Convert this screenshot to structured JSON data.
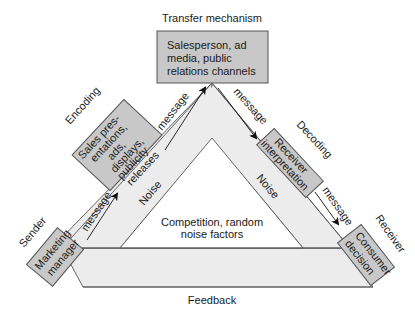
{
  "diagram": {
    "title_top": "Transfer mechanism",
    "bottom_label": "Feedback",
    "center_label": [
      "Competition, random",
      "noise factors"
    ],
    "stages": {
      "sender": {
        "role": "Sender",
        "box_lines": [
          "Marketing",
          "manager"
        ]
      },
      "encoding": {
        "role": "Encoding",
        "box_lines": [
          "Sales pres-",
          "entations,",
          "ads,",
          "displays,",
          "publicity",
          "releases"
        ]
      },
      "transfer": {
        "role": "Transfer mechanism",
        "box_lines": [
          "Salesperson, ad",
          "media, public",
          "relations channels"
        ]
      },
      "decoding": {
        "role": "Decoding",
        "box_lines": [
          "Receiver",
          "interpretation"
        ]
      },
      "receiver": {
        "role": "Receiver",
        "box_lines": [
          "Consumer",
          "decision"
        ]
      }
    },
    "arrows": {
      "sender_to_encoding": "message",
      "encoding_to_transfer": "message",
      "transfer_to_decoding": "message",
      "decoding_to_receiver": "message"
    },
    "noise_labels": {
      "left": "Noise",
      "right": "Noise"
    },
    "colors": {
      "box_fill": "#c8c8c8",
      "band_fill": "#ececec",
      "stroke": "#555555",
      "text": "#1a1a1a"
    }
  }
}
